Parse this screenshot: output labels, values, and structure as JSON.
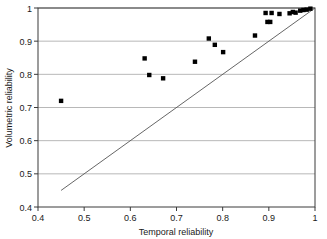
{
  "chart_data": {
    "type": "scatter",
    "title": "",
    "xlabel": "Temporal reliability",
    "ylabel": "Volumetric reliability",
    "xlim": [
      0.4,
      1.0
    ],
    "ylim": [
      0.4,
      1.0
    ],
    "xticks": [
      0.4,
      0.5,
      0.6,
      0.7,
      0.8,
      0.9,
      1.0
    ],
    "yticks": [
      0.4,
      0.5,
      0.6,
      0.7,
      0.8,
      0.9,
      1.0
    ],
    "xtick_labels": [
      "0.4",
      "0.5",
      "0.6",
      "0.7",
      "0.8",
      "0.9",
      "1"
    ],
    "ytick_labels": [
      "0.4",
      "0.5",
      "0.6",
      "0.7",
      "0.8",
      "0.9",
      "1"
    ],
    "grid": "horizontal",
    "legend": "none",
    "marker": "square",
    "marker_color": "#000000",
    "marker_size": 4.4,
    "points": [
      {
        "x": 0.45,
        "y": 0.72
      },
      {
        "x": 0.631,
        "y": 0.848
      },
      {
        "x": 0.641,
        "y": 0.798
      },
      {
        "x": 0.671,
        "y": 0.788
      },
      {
        "x": 0.74,
        "y": 0.838
      },
      {
        "x": 0.77,
        "y": 0.908
      },
      {
        "x": 0.783,
        "y": 0.889
      },
      {
        "x": 0.801,
        "y": 0.867
      },
      {
        "x": 0.87,
        "y": 0.917
      },
      {
        "x": 0.893,
        "y": 0.985
      },
      {
        "x": 0.897,
        "y": 0.958
      },
      {
        "x": 0.903,
        "y": 0.958
      },
      {
        "x": 0.906,
        "y": 0.985
      },
      {
        "x": 0.923,
        "y": 0.982
      },
      {
        "x": 0.945,
        "y": 0.984
      },
      {
        "x": 0.952,
        "y": 0.988
      },
      {
        "x": 0.958,
        "y": 0.986
      },
      {
        "x": 0.968,
        "y": 0.992
      },
      {
        "x": 0.975,
        "y": 0.994
      },
      {
        "x": 0.982,
        "y": 0.995
      },
      {
        "x": 0.99,
        "y": 0.998
      }
    ],
    "reference_line": {
      "name": "one-to-one-line",
      "x1": 0.45,
      "y1": 0.45,
      "x2": 1.0,
      "y2": 1.0,
      "color": "#555555"
    }
  }
}
